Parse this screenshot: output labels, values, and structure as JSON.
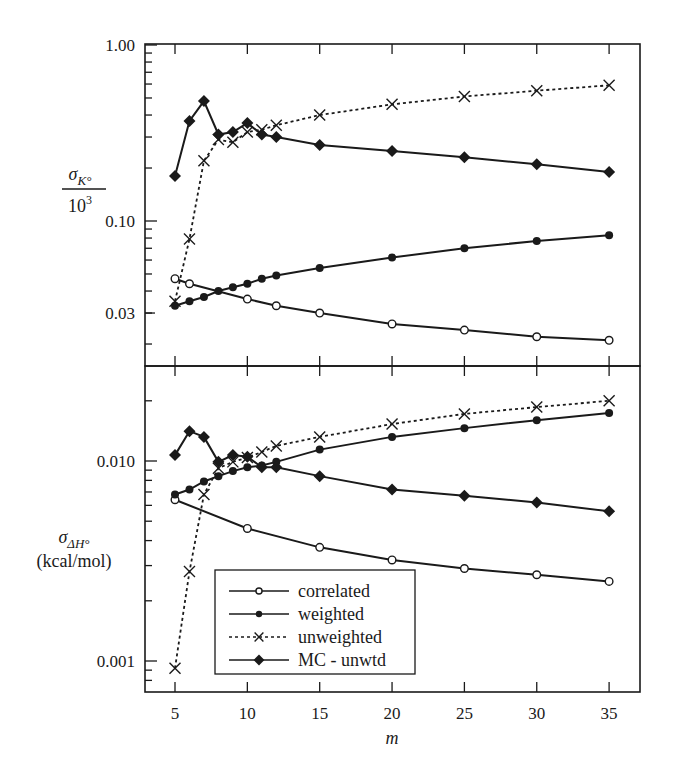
{
  "chart_data": [
    {
      "type": "line",
      "panel": "top",
      "ylabel": "σK° / 10^3",
      "ylabel_parts": {
        "sigma": "σ",
        "sub": "K°",
        "denominator": "10",
        "exp": "3"
      },
      "xlabel": "m",
      "yscale": "log",
      "ylim": [
        0.015,
        1.0
      ],
      "yticks": [
        {
          "value": 1.0,
          "label": "1.00"
        },
        {
          "value": 0.1,
          "label": "0.10"
        },
        {
          "value": 0.03,
          "label": "0.03"
        }
      ],
      "x": [
        5,
        6,
        7,
        8,
        9,
        10,
        11,
        12,
        15,
        20,
        25,
        30,
        35
      ],
      "series": [
        {
          "name": "correlated",
          "marker": "open-circle",
          "line": "solid",
          "x": [
            5,
            6,
            10,
            12,
            15,
            20,
            25,
            30,
            35
          ],
          "values": [
            0.047,
            0.044,
            0.036,
            0.033,
            0.03,
            0.026,
            0.024,
            0.022,
            0.021
          ]
        },
        {
          "name": "weighted",
          "marker": "filled-circle",
          "line": "solid",
          "x": [
            5,
            6,
            7,
            8,
            9,
            10,
            11,
            12,
            15,
            20,
            25,
            30,
            35
          ],
          "values": [
            0.033,
            0.035,
            0.037,
            0.04,
            0.042,
            0.044,
            0.047,
            0.049,
            0.054,
            0.062,
            0.07,
            0.077,
            0.083
          ]
        },
        {
          "name": "unweighted",
          "marker": "x",
          "line": "dashed",
          "x": [
            5,
            6,
            7,
            8,
            9,
            10,
            11,
            12,
            15,
            20,
            25,
            30,
            35
          ],
          "values": [
            0.035,
            0.079,
            0.22,
            0.29,
            0.28,
            0.32,
            0.33,
            0.35,
            0.4,
            0.46,
            0.51,
            0.55,
            0.59
          ]
        },
        {
          "name": "MC - unwtd",
          "marker": "filled-diamond",
          "line": "solid",
          "x": [
            5,
            6,
            7,
            8,
            9,
            10,
            11,
            12,
            15,
            20,
            25,
            30,
            35
          ],
          "values": [
            0.18,
            0.37,
            0.48,
            0.31,
            0.32,
            0.36,
            0.31,
            0.3,
            0.27,
            0.25,
            0.23,
            0.21,
            0.19
          ]
        }
      ]
    },
    {
      "type": "line",
      "panel": "bottom",
      "ylabel": "σΔH° (kcal/mol)",
      "ylabel_parts": {
        "sigma": "σ",
        "sub": "ΔH°",
        "units": "(kcal/mol)"
      },
      "xlabel": "m",
      "yscale": "log",
      "ylim": [
        0.0007,
        0.03
      ],
      "yticks": [
        {
          "value": 0.01,
          "label": "0.010"
        },
        {
          "value": 0.001,
          "label": "0.001"
        }
      ],
      "x": [
        5,
        6,
        7,
        8,
        9,
        10,
        11,
        12,
        15,
        20,
        25,
        30,
        35
      ],
      "series": [
        {
          "name": "correlated",
          "marker": "open-circle",
          "line": "solid",
          "x": [
            5,
            10,
            15,
            20,
            25,
            30,
            35
          ],
          "values": [
            0.0064,
            0.0046,
            0.0037,
            0.0032,
            0.0029,
            0.0027,
            0.0025
          ]
        },
        {
          "name": "weighted",
          "marker": "filled-circle",
          "line": "solid",
          "x": [
            5,
            6,
            7,
            8,
            9,
            10,
            11,
            12,
            15,
            20,
            25,
            30,
            35
          ],
          "values": [
            0.0068,
            0.0072,
            0.0079,
            0.0084,
            0.0089,
            0.0093,
            0.0095,
            0.0099,
            0.0114,
            0.0132,
            0.0146,
            0.016,
            0.0174
          ]
        },
        {
          "name": "unweighted",
          "marker": "x",
          "line": "dashed",
          "x": [
            5,
            6,
            7,
            8,
            9,
            10,
            11,
            12,
            15,
            20,
            25,
            30,
            35
          ],
          "values": [
            0.00092,
            0.0028,
            0.0068,
            0.0092,
            0.0099,
            0.0104,
            0.0111,
            0.0119,
            0.0132,
            0.0153,
            0.0172,
            0.0186,
            0.02
          ]
        },
        {
          "name": "MC - unwtd",
          "marker": "filled-diamond",
          "line": "solid",
          "x": [
            5,
            6,
            7,
            8,
            9,
            10,
            11,
            12,
            15,
            20,
            25,
            30,
            35
          ],
          "values": [
            0.0107,
            0.0141,
            0.0132,
            0.0099,
            0.0107,
            0.0105,
            0.0093,
            0.0093,
            0.0084,
            0.0072,
            0.0067,
            0.0062,
            0.0056
          ]
        }
      ]
    }
  ],
  "x_axis": {
    "label": "m",
    "ticks": [
      {
        "value": 5,
        "label": "5"
      },
      {
        "value": 10,
        "label": "10"
      },
      {
        "value": 15,
        "label": "15"
      },
      {
        "value": 20,
        "label": "20"
      },
      {
        "value": 25,
        "label": "25"
      },
      {
        "value": 30,
        "label": "30"
      },
      {
        "value": 35,
        "label": "35"
      }
    ]
  },
  "legend": {
    "position": "bottom panel, lower-left",
    "entries": [
      {
        "label": "correlated",
        "marker": "open-circle",
        "line": "solid"
      },
      {
        "label": "weighted",
        "marker": "filled-circle",
        "line": "solid"
      },
      {
        "label": "unweighted",
        "marker": "x",
        "line": "dashed"
      },
      {
        "label": "MC - unwtd",
        "marker": "filled-diamond",
        "line": "solid"
      }
    ]
  },
  "colors": {
    "ink": "#1a1a1a",
    "background": "#ffffff"
  }
}
